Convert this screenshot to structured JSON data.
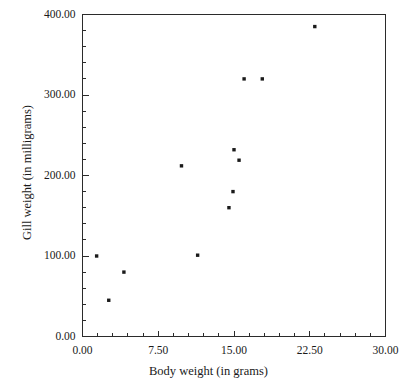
{
  "chart_data": {
    "type": "scatter",
    "title": "",
    "xlabel": "Body weight (in grams)",
    "ylabel": "Gill weight (in milligrams)",
    "xlim": [
      0.0,
      30.0
    ],
    "ylim": [
      0.0,
      400.0
    ],
    "grid": false,
    "legend": null,
    "xticks": [
      0.0,
      7.5,
      15.0,
      22.5,
      30.0
    ],
    "xticklabels": [
      "0.00",
      "7.50",
      "15.00",
      "22.50",
      "30.00"
    ],
    "yticks": [
      0.0,
      100.0,
      200.0,
      300.0,
      400.0
    ],
    "yticklabels": [
      "0.00",
      "100.00",
      "200.00",
      "300.00",
      "400.00"
    ],
    "minor_tick_count_x": 4,
    "minor_tick_count_y": 4,
    "marker": "filled-square",
    "marker_color": "#1a1a1a",
    "points": [
      {
        "x": 1.4,
        "y": 100
      },
      {
        "x": 2.6,
        "y": 45
      },
      {
        "x": 4.1,
        "y": 80
      },
      {
        "x": 9.8,
        "y": 212
      },
      {
        "x": 11.4,
        "y": 101
      },
      {
        "x": 14.5,
        "y": 160
      },
      {
        "x": 14.9,
        "y": 180
      },
      {
        "x": 15.0,
        "y": 232
      },
      {
        "x": 15.5,
        "y": 219
      },
      {
        "x": 16.0,
        "y": 320
      },
      {
        "x": 17.8,
        "y": 320
      },
      {
        "x": 23.0,
        "y": 385
      }
    ]
  },
  "figure": {
    "background_color": "#ffffff",
    "axis_color": "#2b2b2b"
  }
}
